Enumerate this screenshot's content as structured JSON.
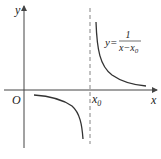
{
  "figure": {
    "axes": {
      "x_label": "x",
      "y_label": "y",
      "origin_label": "O",
      "asymptote_label_main": "x",
      "asymptote_label_sub": "0"
    },
    "equation": {
      "lhs": "y=",
      "numerator": "1",
      "denominator_main": "x−x",
      "denominator_sub": "0"
    },
    "colors": {
      "curve": "#333333",
      "axis": "#444444",
      "asymptote": "#666666"
    }
  }
}
